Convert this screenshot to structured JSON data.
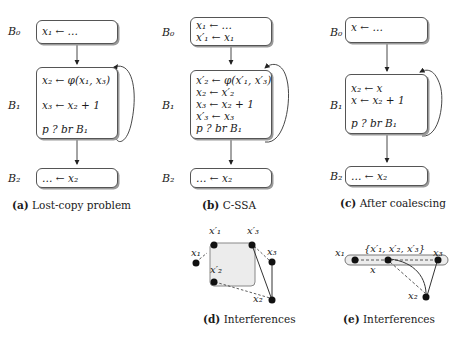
{
  "panels": [
    {
      "id": "a",
      "caption_tag": "(a)",
      "caption_text": "Lost-copy problem",
      "blocks": [
        {
          "name": "B0",
          "label": "B₀",
          "lines": [
            "x₁ ← …"
          ]
        },
        {
          "name": "B1",
          "label": "B₁",
          "lines": [
            "x₂ ← φ(x₁, x₃)",
            "",
            "x₃ ← x₂ + 1",
            "",
            "p ? br B₁"
          ]
        },
        {
          "name": "B2",
          "label": "B₂",
          "lines": [
            "… ← x₂"
          ]
        }
      ]
    },
    {
      "id": "b",
      "caption_tag": "(b)",
      "caption_text": "C-SSA",
      "blocks": [
        {
          "name": "B0",
          "label": "B₀",
          "lines": [
            "x₁ ← …",
            "x′₁ ← x₁"
          ]
        },
        {
          "name": "B1",
          "label": "B₁",
          "lines": [
            "x′₂ ← φ(x′₁, x′₃)",
            "x₂ ← x′₂",
            "x₃ ← x₂ + 1",
            "x′₃ ← x₃",
            "p ? br B₁"
          ]
        },
        {
          "name": "B2",
          "label": "B₂",
          "lines": [
            "… ← x₂"
          ]
        }
      ]
    },
    {
      "id": "c",
      "caption_tag": "(c)",
      "caption_text": "After coalescing",
      "blocks": [
        {
          "name": "B0",
          "label": "B₀",
          "lines": [
            "x ← …"
          ]
        },
        {
          "name": "B1",
          "label": "B₁",
          "lines": [
            "x₂ ← x",
            "x ← x₂ + 1",
            "",
            "p ? br B₁"
          ]
        },
        {
          "name": "B2",
          "label": "B₂",
          "lines": [
            "… ← x₂"
          ]
        }
      ]
    },
    {
      "id": "d",
      "caption_tag": "(d)",
      "caption_text": "Interferences",
      "nodes": [
        {
          "id": "x1",
          "label": "x₁"
        },
        {
          "id": "x1p",
          "label": "x′₁"
        },
        {
          "id": "x3p",
          "label": "x′₃"
        },
        {
          "id": "x2p",
          "label": "x′₂"
        },
        {
          "id": "x3",
          "label": "x₃"
        },
        {
          "id": "x2",
          "label": "x₂"
        }
      ],
      "edges": [
        {
          "from": "x1",
          "to": "x1p",
          "style": "dashed"
        },
        {
          "from": "x3p",
          "to": "x3",
          "style": "dashed"
        },
        {
          "from": "x2p",
          "to": "x2",
          "style": "dashed"
        },
        {
          "from": "x3p",
          "to": "x2",
          "style": "solid"
        },
        {
          "from": "x3",
          "to": "x2",
          "style": "solid"
        }
      ],
      "group": [
        "x1p",
        "x3p",
        "x2p"
      ]
    },
    {
      "id": "e",
      "caption_tag": "(e)",
      "caption_text": "Interferences",
      "nodes": [
        {
          "id": "x1",
          "label": "x₁"
        },
        {
          "id": "xp",
          "label": "{x′₁, x′₂, x′₃}"
        },
        {
          "id": "x3",
          "label": "x₃"
        },
        {
          "id": "x2",
          "label": "x₂"
        }
      ],
      "group_label": "x",
      "edges": [
        {
          "from": "xp",
          "to": "x1",
          "style": "dashed"
        },
        {
          "from": "xp",
          "to": "x3",
          "style": "dashed"
        },
        {
          "from": "xp",
          "to": "x2",
          "style": "dashed"
        },
        {
          "from": "xp",
          "to": "x2",
          "style": "solid-curve"
        },
        {
          "from": "x3",
          "to": "x2",
          "style": "solid"
        }
      ]
    }
  ],
  "colors": {
    "ink": "#1a1a1a",
    "box_border": "#555555",
    "group_fill": "#ececec"
  }
}
